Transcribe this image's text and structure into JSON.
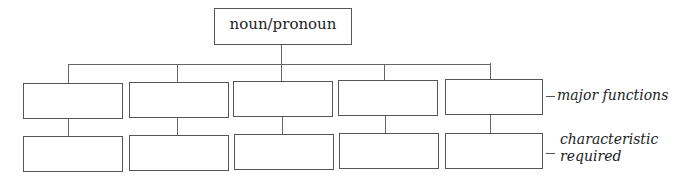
{
  "root": {
    "label": "noun/pronoun"
  },
  "row_labels": {
    "major": "major functions",
    "characteristic_line1": "characteristic",
    "characteristic_line2": "required"
  },
  "columns": [
    {
      "top_box": "",
      "bottom_box": ""
    },
    {
      "top_box": "",
      "bottom_box": ""
    },
    {
      "top_box": "",
      "bottom_box": ""
    },
    {
      "top_box": "",
      "bottom_box": ""
    },
    {
      "top_box": "",
      "bottom_box": ""
    }
  ]
}
